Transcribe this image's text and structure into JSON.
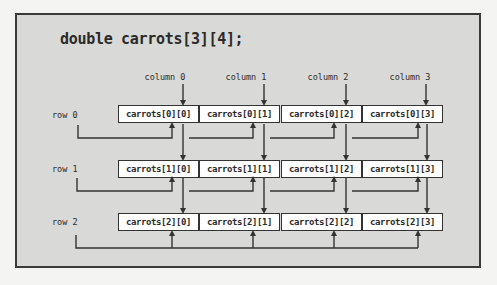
{
  "declaration": "double carrots[3][4];",
  "columns": [
    {
      "label": "column 0",
      "x": 183
    },
    {
      "label": "column 1",
      "x": 264
    },
    {
      "label": "column 2",
      "x": 346
    },
    {
      "label": "column 3",
      "x": 426
    }
  ],
  "rows": [
    {
      "label": "row 0",
      "top": 105,
      "cells": [
        "carrots[0][0]",
        "carrots[0][1]",
        "carrots[0][2]",
        "carrots[0][3]"
      ]
    },
    {
      "label": "row 1",
      "top": 160,
      "cells": [
        "carrots[1][0]",
        "carrots[1][1]",
        "carrots[1][2]",
        "carrots[1][3]"
      ]
    },
    {
      "label": "row 2",
      "top": 213,
      "cells": [
        "carrots[2][0]",
        "carrots[2][1]",
        "carrots[2][2]",
        "carrots[2][3]"
      ]
    }
  ],
  "colors": {
    "frame_bg": "#d9d9d7",
    "page_bg": "#f4f4f2",
    "line": "#333333",
    "cell_bg": "#ffffff"
  }
}
